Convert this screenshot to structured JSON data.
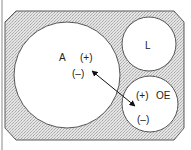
{
  "diagram": {
    "type": "set-diagram",
    "frame": {
      "shape": "octagon",
      "fill_pattern": "stipple",
      "fill_color": "#d9d9d9",
      "stroke_color": "#555555"
    },
    "left_rule": {
      "stroke_color": "#777777"
    },
    "circles": [
      {
        "id": "A",
        "label": "A",
        "signs": {
          "plus": "(+)",
          "minus": "(–)"
        }
      },
      {
        "id": "L",
        "label": "L"
      },
      {
        "id": "OE",
        "label": "OE",
        "signs": {
          "plus": "(+)",
          "minus": "(–)"
        }
      }
    ],
    "arrow": {
      "from": "A",
      "to": "OE",
      "style": "double-headed",
      "color": "#111111"
    }
  }
}
